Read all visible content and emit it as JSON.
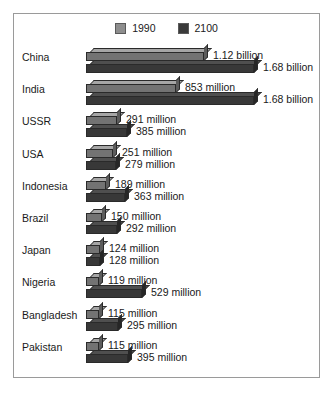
{
  "chart_data": {
    "type": "bar",
    "title": "",
    "subtitle": "",
    "xlabel": "",
    "ylabel": "",
    "orientation": "horizontal",
    "grid": false,
    "legend_position": "top-center",
    "value_unit": "people",
    "categories": [
      "China",
      "India",
      "USSR",
      "USA",
      "Indonesia",
      "Brazil",
      "Japan",
      "Nigeria",
      "Bangladesh",
      "Pakistan"
    ],
    "series": [
      {
        "name": "1990",
        "color": "#737373",
        "values": [
          1120000000,
          853000000,
          291000000,
          251000000,
          189000000,
          150000000,
          124000000,
          119000000,
          115000000,
          115000000
        ],
        "labels": [
          "1.12 billion",
          "853 million",
          "291 million",
          "251 million",
          "189 million",
          "150 million",
          "124 million",
          "119 million",
          "115 million",
          "115 million"
        ]
      },
      {
        "name": "2100",
        "color": "#383838",
        "values": [
          1680000000,
          1680000000,
          385000000,
          279000000,
          363000000,
          292000000,
          128000000,
          529000000,
          295000000,
          395000000
        ],
        "labels": [
          "1.68 billion",
          "1.68 billion",
          "385 million",
          "279 million",
          "363 million",
          "292 million",
          "128 million",
          "529 million",
          "295 million",
          "395 million"
        ]
      }
    ],
    "xlim": [
      0,
      1680000000
    ]
  },
  "legend": {
    "entries": [
      {
        "label": "1990",
        "color": "#8e8e8e"
      },
      {
        "label": "2100",
        "color": "#3a3a3a"
      }
    ]
  },
  "rows": [
    {
      "label": "China",
      "v1990": "1.12 billion",
      "v2100": "1.68 billion",
      "w1990": 118,
      "w2100": 168
    },
    {
      "label": "India",
      "v1990": "853 million",
      "v2100": "1.68 billion",
      "w1990": 90,
      "w2100": 168
    },
    {
      "label": "USSR",
      "v1990": "291 million",
      "v2100": "385 million",
      "w1990": 31,
      "w2100": 41
    },
    {
      "label": "USA",
      "v1990": "251 million",
      "v2100": "279 million",
      "w1990": 27,
      "w2100": 30
    },
    {
      "label": "Indonesia",
      "v1990": "189 million",
      "v2100": "363 million",
      "w1990": 20,
      "w2100": 39
    },
    {
      "label": "Brazil",
      "v1990": "150 million",
      "v2100": "292 million",
      "w1990": 16,
      "w2100": 31
    },
    {
      "label": "Japan",
      "v1990": "124 million",
      "v2100": "128 million",
      "w1990": 14,
      "w2100": 14
    },
    {
      "label": "Nigeria",
      "v1990": "119 million",
      "v2100": "529 million",
      "w1990": 13,
      "w2100": 56
    },
    {
      "label": "Bangladesh",
      "v1990": "115 million",
      "v2100": "295 million",
      "w1990": 13,
      "w2100": 32
    },
    {
      "label": "Pakistan",
      "v1990": "115 million",
      "v2100": "395 million",
      "w1990": 13,
      "w2100": 42
    }
  ]
}
